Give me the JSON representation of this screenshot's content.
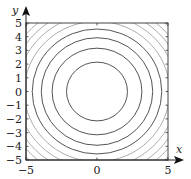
{
  "chart_data": {
    "type": "contour",
    "title": "",
    "function": "x^2 + y^2",
    "xlabel": "x",
    "ylabel": "y",
    "xlim": [
      -5,
      5
    ],
    "ylim": [
      -5,
      5
    ],
    "x_ticks": [
      -5,
      0,
      5
    ],
    "x_tick_labels": [
      "−5",
      "0",
      "5"
    ],
    "y_ticks": [
      -5,
      -4,
      -3,
      -2,
      -1,
      0,
      1,
      2,
      3,
      4,
      5
    ],
    "y_tick_labels": [
      "−5",
      "−4",
      "−3",
      "−2",
      "−1",
      "0",
      "1",
      "2",
      "3",
      "4",
      "5"
    ],
    "contour_levels_r2": [
      4.6,
      10,
      15.4,
      20.8,
      26.2,
      31.6,
      37,
      42.4,
      47.8
    ],
    "center": [
      0,
      0
    ],
    "grid": false,
    "legend": null,
    "colors": {
      "contour": "#555555",
      "axis": "#222222",
      "frame": "#444444"
    }
  }
}
